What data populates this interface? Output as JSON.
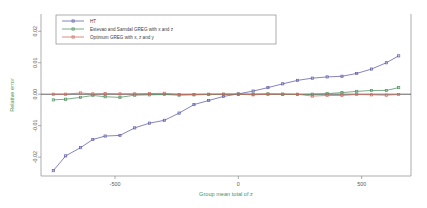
{
  "chart_data": {
    "type": "line",
    "title": "",
    "xlabel": "Group mean total of z",
    "ylabel": "Relative error",
    "xlim": [
      -800,
      700
    ],
    "ylim": [
      -0.026,
      0.0255
    ],
    "xticks": [
      -500,
      0,
      500
    ],
    "xtick_labels": [
      "-500",
      "0",
      "500"
    ],
    "yticks": [
      -0.02,
      -0.01,
      0.0,
      0.01,
      0.02
    ],
    "ytick_labels": [
      "-0.02",
      "-0.01",
      "0.00",
      "0.01",
      "0.02"
    ],
    "grid": false,
    "zero_reference_line": 0.0,
    "legend_position": "top-left",
    "x": [
      -750,
      -700,
      -640,
      -590,
      -540,
      -480,
      -420,
      -360,
      -300,
      -240,
      -180,
      -120,
      -60,
      0,
      60,
      120,
      180,
      240,
      300,
      360,
      420,
      480,
      540,
      600,
      650
    ],
    "series": [
      {
        "name": "HT",
        "color": "#5b5ba8",
        "marker": "square",
        "values": [
          -0.0243,
          -0.0196,
          -0.017,
          -0.0144,
          -0.0133,
          -0.0131,
          -0.0107,
          -0.0092,
          -0.0083,
          -0.006,
          -0.0033,
          -0.002,
          -0.0007,
          0.0001,
          0.001,
          0.0021,
          0.0033,
          0.0044,
          0.0051,
          0.0055,
          0.0057,
          0.0066,
          0.008,
          0.01,
          0.0122
        ]
      },
      {
        "name": "Estevao and Sarndal GREG with x and z",
        "color": "#4f8f5f",
        "marker": "square",
        "values": [
          -0.0018,
          -0.0016,
          -0.001,
          -0.0004,
          -0.0008,
          -0.001,
          -0.0003,
          -0.0002,
          -0.0001,
          -0.0003,
          -0.0002,
          -0.0001,
          0.0,
          0.0,
          0.0,
          0.0001,
          0.0,
          -0.0001,
          0.0,
          0.0002,
          0.0005,
          0.0009,
          0.0012,
          0.0012,
          0.0021
        ]
      },
      {
        "name": "Optimum GREG with x, z and y",
        "color": "#c96a5c",
        "marker": "square",
        "values": [
          0.0,
          0.0,
          0.0004,
          0.0001,
          0.0002,
          0.0001,
          0.0001,
          0.0002,
          0.0003,
          -0.0001,
          -0.0001,
          0.0,
          0.0,
          0.0,
          -0.0002,
          0.0,
          0.0,
          0.0,
          -0.0006,
          -0.0004,
          -0.0004,
          -0.0001,
          -0.0002,
          -0.0003,
          -0.0001
        ]
      }
    ]
  }
}
